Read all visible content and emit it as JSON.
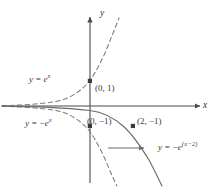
{
  "figure": {
    "type": "math-graph",
    "width": 217,
    "height": 190,
    "background": "#ffffff",
    "stroke_color": "#6b6b6b",
    "axis_color": "#4a4a4a",
    "text_color": "#3a3a3a"
  },
  "axes": {
    "x_label": "x",
    "y_label": "y",
    "origin_px": {
      "x": 90,
      "y": 106
    },
    "units_per_px": 21.5,
    "x_range": [
      -4.2,
      5.6
    ],
    "y_range": [
      -3.9,
      4.5
    ],
    "grid": false
  },
  "curves": [
    {
      "name": "y-equals-e-to-the-x",
      "label_html": "y = e<sup>x</sup>",
      "label_plain": "y = e^x",
      "style": "dashed",
      "color": "#7a7a7a",
      "label_pos_px": {
        "x": 29,
        "y": 79
      }
    },
    {
      "name": "y-equals-negative-e-to-the-x",
      "label_html": "y = −e<sup>x</sup>",
      "label_plain": "y = -e^x",
      "style": "dashed",
      "color": "#7a7a7a",
      "label_pos_px": {
        "x": 27,
        "y": 123
      }
    },
    {
      "name": "y-equals-negative-e-to-the-x-minus-2",
      "label_html": "y = −e<sup>(x−2)</sup>",
      "label_plain": "y = -e^(x-2)",
      "style": "solid",
      "color": "#6b6b6b",
      "label_pos_px": {
        "x": 160,
        "y": 147
      }
    }
  ],
  "points": [
    {
      "name": "point-0-1",
      "label": "(0, 1)",
      "coords": [
        0,
        1
      ],
      "px": {
        "x": 90,
        "y": 81
      },
      "label_pos_px": {
        "x": 95,
        "y": 85
      }
    },
    {
      "name": "point-0-neg1",
      "label": "(0, −1)",
      "coords": [
        0,
        -1
      ],
      "px": {
        "x": 90,
        "y": 126
      },
      "label_pos_px": {
        "x": 88,
        "y": 119
      }
    },
    {
      "name": "point-2-neg1",
      "label": "(2, −1)",
      "coords": [
        2,
        -1
      ],
      "px": {
        "x": 133,
        "y": 126
      },
      "label_pos_px": {
        "x": 138,
        "y": 119
      }
    }
  ],
  "annotations": [
    {
      "name": "shift-arrow",
      "description": "horizontal arrow indicating translation",
      "from_px": {
        "x": 108,
        "y": 148
      },
      "to_px": {
        "x": 145,
        "y": 148
      }
    }
  ],
  "chart_data": {
    "type": "line",
    "title": "",
    "xlabel": "x",
    "ylabel": "y",
    "xlim": [
      -4.2,
      5.6
    ],
    "ylim": [
      -3.9,
      4.5
    ],
    "grid": false,
    "legend": "inline-labels",
    "series": [
      {
        "name": "y = e^x",
        "style": "dashed",
        "x": [
          -4.2,
          -3.5,
          -3.0,
          -2.5,
          -2.0,
          -1.5,
          -1.0,
          -0.5,
          0.0,
          0.5,
          1.0,
          1.2,
          1.4
        ],
        "y": [
          0.015,
          0.03,
          0.05,
          0.082,
          0.135,
          0.223,
          0.368,
          0.607,
          1.0,
          1.649,
          2.718,
          3.32,
          4.055
        ]
      },
      {
        "name": "y = -e^x",
        "style": "dashed",
        "x": [
          -4.2,
          -3.5,
          -3.0,
          -2.5,
          -2.0,
          -1.5,
          -1.0,
          -0.5,
          0.0,
          0.5,
          1.0,
          1.2,
          1.35
        ],
        "y": [
          -0.015,
          -0.03,
          -0.05,
          -0.082,
          -0.135,
          -0.223,
          -0.368,
          -0.607,
          -1.0,
          -1.649,
          -2.718,
          -3.32,
          -3.86
        ]
      },
      {
        "name": "y = -e^(x-2)",
        "style": "solid",
        "x": [
          -4.2,
          -3.0,
          -2.0,
          -1.0,
          0.0,
          0.5,
          1.0,
          1.5,
          2.0,
          2.5,
          3.0,
          3.2,
          3.35
        ],
        "y": [
          -0.002,
          -0.0067,
          -0.018,
          -0.05,
          -0.135,
          -0.223,
          -0.368,
          -0.607,
          -1.0,
          -1.649,
          -2.718,
          -3.32,
          -3.86
        ]
      }
    ],
    "points": [
      {
        "label": "(0, 1)",
        "x": 0,
        "y": 1
      },
      {
        "label": "(0, -1)",
        "x": 0,
        "y": -1
      },
      {
        "label": "(2, -1)",
        "x": 2,
        "y": -1
      }
    ]
  }
}
